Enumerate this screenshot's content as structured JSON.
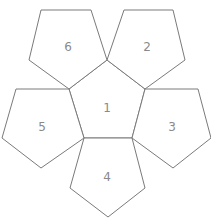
{
  "diagram": {
    "stroke_color": "#7a7a7a",
    "label_color": "#8a8a8a",
    "faces": [
      {
        "label": "1",
        "points": "107,60 145,89 132,138 84,138 69,89",
        "cx": 107,
        "cy": 108
      },
      {
        "label": "2",
        "points": "124,10 173,10 185,60 145,89 107,60",
        "cx": 147,
        "cy": 47
      },
      {
        "label": "3",
        "points": "145,89 198,89 211,138 173,168 132,138",
        "cx": 172,
        "cy": 127
      },
      {
        "label": "4",
        "points": "84,138 132,138 145,188 108,217 70,188",
        "cx": 107,
        "cy": 177
      },
      {
        "label": "5",
        "points": "16,89 69,89 84,138 41,168 2,138",
        "cx": 42,
        "cy": 127
      },
      {
        "label": "6",
        "points": "41,10 91,10 107,60 69,89 29,60",
        "cx": 68,
        "cy": 47
      }
    ]
  }
}
